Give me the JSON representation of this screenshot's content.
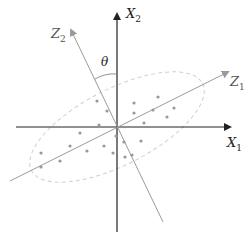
{
  "labels": {
    "x1": "X",
    "x1_sub": "1",
    "x2": "X",
    "x2_sub": "2",
    "z1": "Z",
    "z1_sub": "1",
    "z2": "Z",
    "z2_sub": "2",
    "theta": "θ"
  },
  "colors": {
    "axis": "#222222",
    "rotated_axis": "#9a9a9a",
    "points": "#999999",
    "ellipse": "#d0d0d0"
  },
  "points": [
    [
      97,
      101
    ],
    [
      107,
      111
    ],
    [
      99,
      125
    ],
    [
      80,
      133
    ],
    [
      70,
      146
    ],
    [
      41,
      153
    ],
    [
      60,
      161
    ],
    [
      41,
      167
    ],
    [
      87,
      151
    ],
    [
      104,
      146
    ],
    [
      113,
      153
    ],
    [
      116,
      136
    ],
    [
      124,
      142
    ],
    [
      125,
      157
    ],
    [
      132,
      155
    ],
    [
      141,
      141
    ],
    [
      134,
      103
    ],
    [
      134,
      113
    ],
    [
      153,
      110
    ],
    [
      158,
      97
    ],
    [
      174,
      108
    ],
    [
      167,
      117
    ],
    [
      144,
      123
    ]
  ]
}
